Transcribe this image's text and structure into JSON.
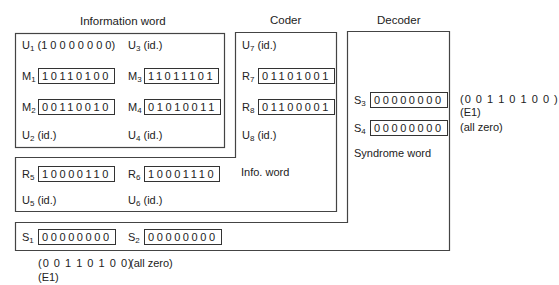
{
  "titles": {
    "information_word": "Information word",
    "coder": "Coder",
    "decoder": "Decoder"
  },
  "information_word_box": {
    "u1": {
      "name": "U",
      "sub": "1",
      "text": "(1 0 0 0 0 0 0 0)"
    },
    "u3": {
      "name": "U",
      "sub": "3",
      "text": "(id.)"
    },
    "m1": {
      "name": "M",
      "sub": "1",
      "bits": "10110100"
    },
    "m3": {
      "name": "M",
      "sub": "3",
      "bits": "11011101"
    },
    "m2": {
      "name": "M",
      "sub": "2",
      "bits": "00110010"
    },
    "m4": {
      "name": "M",
      "sub": "4",
      "bits": "01010011"
    },
    "u2": {
      "name": "U",
      "sub": "2",
      "text": "(id.)"
    },
    "u4": {
      "name": "U",
      "sub": "4",
      "text": "(id.)"
    }
  },
  "coder_box": {
    "u7": {
      "name": "U",
      "sub": "7",
      "text": "(id.)"
    },
    "r7": {
      "name": "R",
      "sub": "7",
      "bits": "01101001"
    },
    "r8": {
      "name": "R",
      "sub": "8",
      "bits": "01100001"
    },
    "u8": {
      "name": "U",
      "sub": "8",
      "text": "(id.)"
    },
    "r5": {
      "name": "R",
      "sub": "5",
      "bits": "10000110"
    },
    "r6": {
      "name": "R",
      "sub": "6",
      "bits": "10001110"
    },
    "info_word_label": "Info. word",
    "u5": {
      "name": "U",
      "sub": "5",
      "text": "(id.)"
    },
    "u6": {
      "name": "U",
      "sub": "6",
      "text": "(id.)"
    }
  },
  "decoder_box": {
    "s3": {
      "name": "S",
      "sub": "3",
      "bits": "00000000"
    },
    "s4": {
      "name": "S",
      "sub": "4",
      "bits": "00000000"
    },
    "syndrome_label": "Syndrome word",
    "s1": {
      "name": "S",
      "sub": "1",
      "bits": "00000000"
    },
    "s2": {
      "name": "S",
      "sub": "2",
      "bits": "00000000"
    }
  },
  "annotations": {
    "s3_value": "(0 0 1 1 0 1 0 0 )",
    "s3_error": "(E1)",
    "s4_value": "(all zero)",
    "s1_value": "(0 0 1 1 0 1 0 0)",
    "s1_error": "(E1)",
    "s2_value": "(all zero)"
  },
  "colors": {
    "line": "#444444",
    "text": "#222222",
    "background": "#ffffff"
  }
}
